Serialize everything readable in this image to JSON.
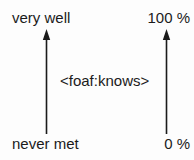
{
  "figure": {
    "background_color": "#fdfdfd",
    "ink_color": "#1b1b1b"
  },
  "relation": {
    "label": "<foaf:knows>"
  },
  "scales": [
    {
      "name": "qualitative",
      "top_label": "very well",
      "bottom_label": "never met",
      "arrow": "up-arrow-icon"
    },
    {
      "name": "percentage",
      "top_label": "100 %",
      "bottom_label": "0 %",
      "arrow": "up-arrow-icon"
    }
  ],
  "axes": {
    "left": {
      "top": "very well",
      "bottom": "never met"
    },
    "right": {
      "top": "100 %",
      "bottom": "0 %"
    }
  }
}
